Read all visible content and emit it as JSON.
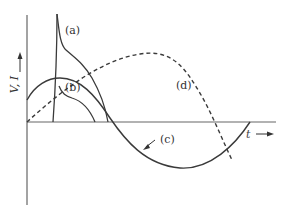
{
  "diagram": {
    "axes": {
      "y_label": "V, I",
      "x_label": "t"
    },
    "curves": [
      {
        "id": "a",
        "label": "(a)",
        "style": "solid"
      },
      {
        "id": "b",
        "label": "(b)",
        "style": "solid"
      },
      {
        "id": "c",
        "label": "(c)",
        "style": "solid"
      },
      {
        "id": "d",
        "label": "(d)",
        "style": "dashed"
      }
    ],
    "colors": {
      "line": "#3a3a3a",
      "axis": "#555555",
      "background": "#ffffff"
    }
  }
}
